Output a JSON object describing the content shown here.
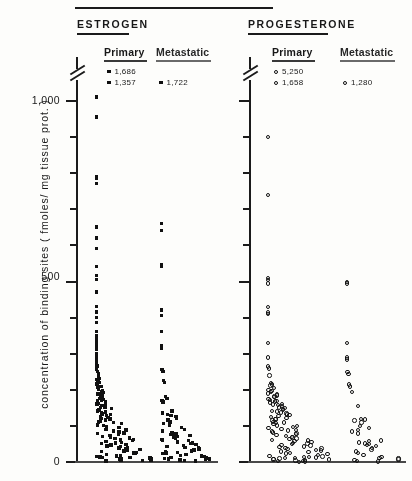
{
  "figure": {
    "y_axis_label": "concentration of binding sites  ( fmoles/ mg tissue prot. )",
    "y_ticks": [
      {
        "label": "1,000",
        "value": 1000
      },
      {
        "label": "500",
        "value": 500
      },
      {
        "label": "0",
        "value": 0
      }
    ],
    "y_tick_values_minor": [
      1000,
      900,
      800,
      700,
      600,
      500,
      400,
      300,
      200,
      100,
      0
    ],
    "axis_break": true,
    "axis_break_note": "scale break drawn above 1,000"
  },
  "sections": [
    {
      "id": "estrogen",
      "title": "ESTROGEN",
      "marker": "filled-square",
      "columns": [
        {
          "id": "estrogen-primary",
          "label": "Primary",
          "offscale_values": [
            "1,686",
            "1,357"
          ]
        },
        {
          "id": "estrogen-metastatic",
          "label": "Metastatic",
          "offscale_values": [
            "1,722"
          ]
        }
      ]
    },
    {
      "id": "progesterone",
      "title": "PROGESTERONE",
      "marker": "open-circle",
      "columns": [
        {
          "id": "progesterone-primary",
          "label": "Primary",
          "offscale_values": [
            "5,250",
            "1,658"
          ]
        },
        {
          "id": "progesterone-metastatic",
          "label": "Metastatic",
          "offscale_values": [
            "1,280"
          ]
        }
      ]
    }
  ],
  "chart_data": {
    "type": "scatter",
    "title": "",
    "xlabel": "",
    "ylabel": "concentration of binding sites ( fmoles/ mg tissue prot. )",
    "ylim": [
      0,
      1050
    ],
    "grid": false,
    "legend": "none",
    "note": "Dot-density strip plot; each point is one tumour specimen. Points jittered horizontally within each column. Values above the axis break are printed as text at the top of each column.",
    "series": [
      {
        "name": "Estrogen Primary",
        "marker": "filled-square",
        "offscale": [
          1686,
          1357
        ],
        "values": [
          1010,
          955,
          790,
          785,
          770,
          650,
          620,
          590,
          540,
          515,
          505,
          470,
          430,
          415,
          400,
          385,
          360,
          350,
          340,
          330,
          320,
          310,
          300,
          295,
          285,
          275,
          265,
          255,
          250,
          245,
          240,
          235,
          230,
          228,
          225,
          220,
          215,
          212,
          208,
          205,
          200,
          198,
          195,
          192,
          190,
          188,
          185,
          182,
          180,
          178,
          175,
          172,
          170,
          168,
          165,
          162,
          160,
          158,
          155,
          152,
          150,
          148,
          145,
          142,
          140,
          138,
          135,
          132,
          130,
          128,
          125,
          122,
          120,
          118,
          115,
          112,
          110,
          108,
          105,
          102,
          100,
          98,
          95,
          92,
          90,
          88,
          85,
          82,
          80,
          78,
          75,
          72,
          70,
          68,
          66,
          64,
          62,
          60,
          58,
          56,
          54,
          52,
          50,
          48,
          46,
          44,
          42,
          40,
          38,
          36,
          34,
          32,
          30,
          28,
          26,
          24,
          22,
          20,
          18,
          16,
          15,
          14,
          13,
          12,
          11,
          10,
          9,
          8,
          7,
          6,
          5,
          4,
          3,
          2
        ]
      },
      {
        "name": "Estrogen Metastatic",
        "marker": "filled-square",
        "offscale": [
          1722
        ],
        "values": [
          660,
          640,
          545,
          540,
          420,
          405,
          360,
          320,
          315,
          255,
          250,
          225,
          220,
          180,
          175,
          170,
          165,
          140,
          135,
          130,
          128,
          125,
          120,
          115,
          110,
          105,
          100,
          95,
          90,
          85,
          80,
          78,
          75,
          72,
          70,
          68,
          65,
          62,
          60,
          58,
          55,
          52,
          50,
          48,
          45,
          42,
          40,
          38,
          35,
          32,
          30,
          28,
          26,
          24,
          22,
          20,
          18,
          16,
          14,
          12,
          10,
          9,
          8,
          7,
          6,
          5,
          4,
          3,
          2
        ]
      },
      {
        "name": "Progesterone Primary",
        "marker": "open-circle",
        "offscale": [
          5250,
          1658
        ],
        "values": [
          900,
          740,
          510,
          505,
          495,
          430,
          415,
          410,
          330,
          290,
          265,
          260,
          240,
          220,
          215,
          212,
          205,
          200,
          198,
          195,
          190,
          188,
          185,
          182,
          180,
          175,
          172,
          170,
          168,
          165,
          162,
          160,
          158,
          155,
          152,
          150,
          148,
          145,
          142,
          140,
          138,
          135,
          132,
          130,
          128,
          125,
          122,
          120,
          118,
          115,
          112,
          110,
          108,
          105,
          102,
          100,
          98,
          95,
          92,
          90,
          88,
          85,
          82,
          80,
          78,
          75,
          72,
          70,
          68,
          66,
          64,
          62,
          60,
          58,
          56,
          54,
          52,
          50,
          48,
          46,
          44,
          42,
          40,
          38,
          36,
          34,
          32,
          30,
          28,
          26,
          24,
          22,
          20,
          18,
          16,
          15,
          14,
          13,
          12,
          11,
          10,
          9,
          8,
          7,
          6,
          5,
          4,
          3,
          2,
          1
        ]
      },
      {
        "name": "Progesterone Metastatic",
        "marker": "open-circle",
        "offscale": [
          1280
        ],
        "values": [
          500,
          495,
          330,
          290,
          285,
          250,
          245,
          215,
          210,
          195,
          155,
          120,
          118,
          115,
          110,
          100,
          95,
          90,
          85,
          80,
          60,
          58,
          55,
          52,
          50,
          48,
          45,
          40,
          35,
          30,
          25,
          20,
          15,
          12,
          10,
          8,
          6,
          4,
          2
        ]
      }
    ]
  }
}
